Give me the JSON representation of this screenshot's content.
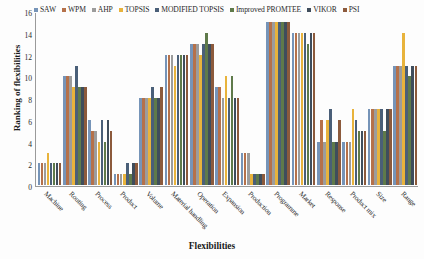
{
  "chart_data": {
    "type": "bar",
    "title": "",
    "xlabel": "Flexibilities",
    "ylabel": "Ranking of flexibilities",
    "ylim": [
      0,
      16
    ],
    "yticks": [
      0,
      2,
      4,
      6,
      8,
      10,
      12,
      14,
      16
    ],
    "grid": false,
    "legend_position": "top",
    "categories": [
      "Machine",
      "Routing",
      "Process",
      "Product",
      "Volume",
      "Material handling",
      "Operation",
      "Expansion",
      "Production",
      "Programme",
      "Market",
      "Response",
      "Product mix",
      "Size",
      "Range"
    ],
    "series": [
      {
        "name": "SAW",
        "color": "#7694b8",
        "values": [
          2,
          10,
          6,
          1,
          8,
          12,
          13,
          9,
          3,
          15,
          14,
          4,
          4,
          7,
          11
        ]
      },
      {
        "name": "WPM",
        "color": "#b5714a",
        "values": [
          2,
          10,
          5,
          1,
          8,
          12,
          13,
          9,
          3,
          15,
          14,
          6,
          4,
          7,
          11
        ]
      },
      {
        "name": "AHP",
        "color": "#9c9c9c",
        "values": [
          2,
          10,
          5,
          1,
          8,
          12,
          13,
          8,
          3,
          15,
          14,
          4,
          4,
          7,
          11
        ]
      },
      {
        "name": "TOPSIS",
        "color": "#e8b33c",
        "values": [
          3,
          9,
          4,
          1,
          8,
          11,
          12,
          10,
          1,
          15,
          14,
          6,
          7,
          7,
          14
        ]
      },
      {
        "name": "MODIFIED TOPSIS",
        "color": "#4a5f78",
        "values": [
          2,
          11,
          6,
          2,
          9,
          12,
          13,
          8,
          1,
          15,
          14,
          7,
          6,
          7,
          11
        ]
      },
      {
        "name": "Improved PROMTEE",
        "color": "#5f7a4a",
        "values": [
          2,
          9,
          4,
          1,
          8,
          12,
          14,
          10,
          1,
          15,
          13,
          4,
          5,
          5,
          10
        ]
      },
      {
        "name": "VIKOR",
        "color": "#3f4d5c",
        "values": [
          2,
          9,
          6,
          2,
          8,
          12,
          13,
          8,
          1,
          15,
          14,
          4,
          5,
          7,
          11
        ]
      },
      {
        "name": "PSI",
        "color": "#8c5a3c",
        "values": [
          2,
          9,
          5,
          2,
          9,
          12,
          13,
          8,
          1,
          15,
          14,
          6,
          5,
          7,
          11
        ]
      }
    ]
  }
}
